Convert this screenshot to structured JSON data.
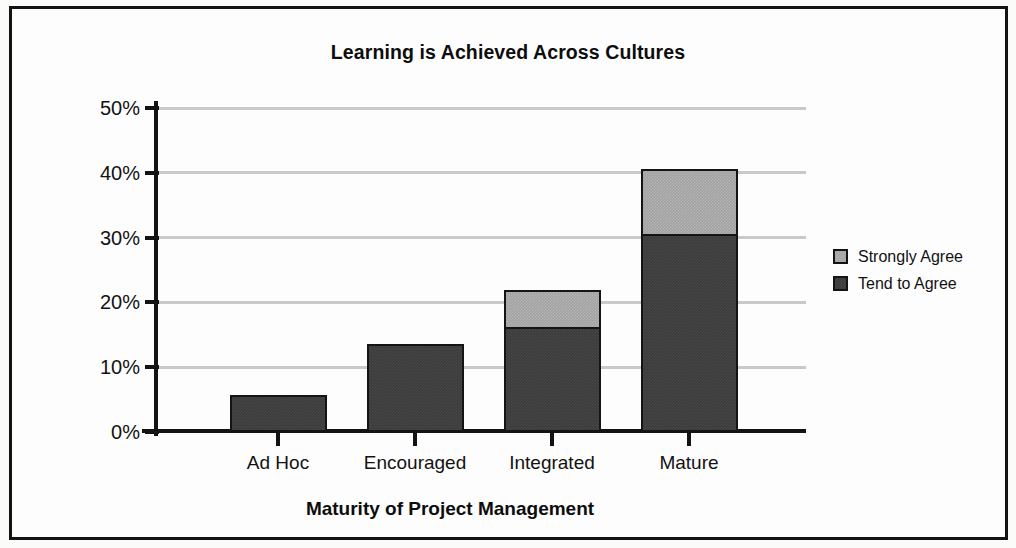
{
  "chart_data": {
    "type": "bar",
    "stacked": true,
    "title": "Learning is Achieved Across Cultures",
    "xlabel": "Maturity of Project Management",
    "ylabel": "",
    "categories": [
      "Ad Hoc",
      "Encouraged",
      "Integrated",
      "Mature"
    ],
    "series": [
      {
        "name": "Tend to Agree",
        "values": [
          5.4,
          13.3,
          15.9,
          30.2
        ],
        "color": "#3b3b3b"
      },
      {
        "name": "Strongly Agree",
        "values": [
          0.0,
          0.0,
          5.7,
          10.1
        ],
        "color": "#a2a2a2"
      }
    ],
    "totals": [
      5.4,
      13.3,
      21.6,
      40.3
    ],
    "ylim": [
      0,
      50
    ],
    "ytick_values": [
      0,
      10,
      20,
      30,
      40,
      50
    ],
    "ytick_labels": [
      "0%",
      "10%",
      "20%",
      "30%",
      "40%",
      "50%"
    ],
    "grid": "horizontal",
    "legend_position": "right",
    "legend_order": [
      "Strongly Agree",
      "Tend to Agree"
    ]
  },
  "colors": {
    "strongly_agree": "#a2a2a2",
    "tend_to_agree": "#3b3b3b",
    "gridline": "#c9c9c9",
    "axis": "#131313",
    "background": "#fdfdfd"
  }
}
